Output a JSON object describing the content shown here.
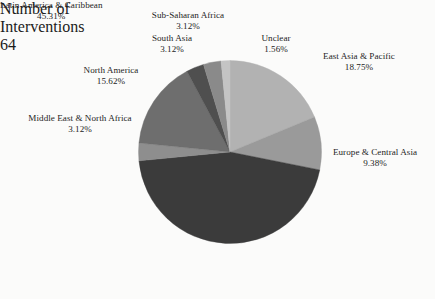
{
  "chart_data": {
    "type": "pie",
    "title": "",
    "subtitle": "",
    "xlabel": "",
    "ylabel": "",
    "legend_position": "bottom-right",
    "grid": false,
    "start_angle_deg": 0,
    "direction": "clockwise",
    "total_interventions": 64,
    "categories": [
      "East Asia & Pacific",
      "Europe & Central Asia",
      "Latin America & Caribbean",
      "Middle East & North Africa",
      "North America",
      "South Asia",
      "Sub-Saharan Africa",
      "Unclear"
    ],
    "values": [
      18.75,
      9.38,
      45.31,
      3.12,
      15.62,
      3.12,
      3.12,
      1.56
    ],
    "value_labels": [
      "18.75%",
      "9.38%",
      "45.31%",
      "3.12%",
      "15.62%",
      "3.12%",
      "3.12%",
      "1.56%"
    ],
    "colors": [
      "#b2b2b2",
      "#9a9a9a",
      "#3b3b3b",
      "#8e8e8e",
      "#6e6e6e",
      "#4f4f4f",
      "#8a8a8a",
      "#c4c4c4"
    ],
    "slices": [
      {
        "label": "East Asia & Pacific",
        "percent_label": "18.75%",
        "value": 18.75,
        "color": "#b2b2b2"
      },
      {
        "label": "Europe & Central Asia",
        "percent_label": "9.38%",
        "value": 9.38,
        "color": "#9a9a9a"
      },
      {
        "label": "Latin America & Caribbean",
        "percent_label": "45.31%",
        "value": 45.31,
        "color": "#3b3b3b"
      },
      {
        "label": "Middle East & North Africa",
        "percent_label": "3.12%",
        "value": 3.12,
        "color": "#8e8e8e"
      },
      {
        "label": "North America",
        "percent_label": "15.62%",
        "value": 15.62,
        "color": "#6e6e6e"
      },
      {
        "label": "South Asia",
        "percent_label": "3.12%",
        "value": 3.12,
        "color": "#4f4f4f"
      },
      {
        "label": "Sub-Saharan Africa",
        "percent_label": "3.12%",
        "value": 3.12,
        "color": "#8a8a8a"
      },
      {
        "label": "Unclear",
        "percent_label": "1.56%",
        "value": 1.56,
        "color": "#c4c4c4"
      }
    ]
  },
  "labels": {
    "sub_saharan_africa": {
      "name": "Sub-Saharan Africa",
      "percent": "3.12%"
    },
    "unclear": {
      "name": "Unclear",
      "percent": "1.56%"
    },
    "south_asia": {
      "name": "South Asia",
      "percent": "3.12%"
    },
    "east_asia_pacific": {
      "name": "East Asia & Pacific",
      "percent": "18.75%"
    },
    "north_america": {
      "name": "North America",
      "percent": "15.62%"
    },
    "europe_central_asia": {
      "name": "Europe & Central Asia",
      "percent": "9.38%"
    },
    "middle_east_north_africa": {
      "name": "Middle East & North Africa",
      "percent": "3.12%"
    },
    "latin_america_caribbean": {
      "name": "Latin America & Caribbean",
      "percent": "45.31%"
    }
  },
  "legend": {
    "title_line1": "Number of",
    "title_line2": "Interventions",
    "value": "64",
    "swatch_color": "#c4c4c4"
  }
}
